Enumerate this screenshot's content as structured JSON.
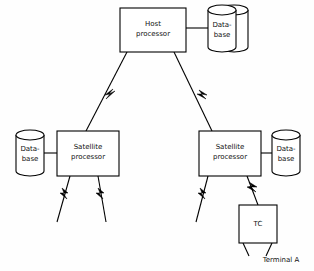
{
  "diagram": {
    "background_color": "#fefefe",
    "line_color": "#000000",
    "text_color": "#111111",
    "nodes": {
      "host_processor": {
        "line1": "Host",
        "line2": "processor"
      },
      "host_database": {
        "line1": "Data-",
        "line2": "base"
      },
      "left_satellite": {
        "line1": "Satellite",
        "line2": "processor"
      },
      "left_database": {
        "line1": "Data-",
        "line2": "base"
      },
      "right_satellite": {
        "line1": "Satellite",
        "line2": "processor"
      },
      "right_database": {
        "line1": "Data-",
        "line2": "base"
      },
      "tc": {
        "label": "TC"
      }
    },
    "labels": {
      "terminal_a": "Terminal A"
    },
    "icons": {
      "database": "database-cylinder-icon",
      "link_break": "lightning-bolt-icon"
    }
  }
}
